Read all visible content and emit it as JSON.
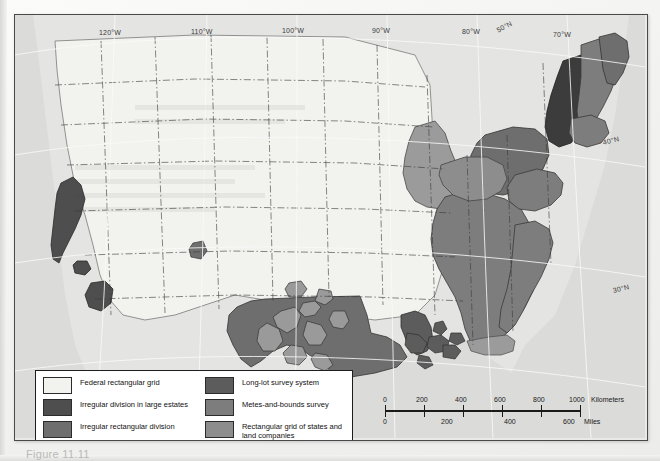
{
  "document": {
    "type": "map-figure",
    "caption": "Figure 11.11"
  },
  "map": {
    "title": "Land survey systems of the United States",
    "background_color": "#e9e9e7",
    "ocean_color": "#dededc",
    "frame_color": "#4a4a4a",
    "graticule": {
      "longitude_labels": [
        "120°W",
        "110°W",
        "100°W",
        "90°W",
        "80°W",
        "70°W"
      ],
      "latitude_labels": [
        "50°N",
        "40°N",
        "30°N"
      ]
    }
  },
  "legend": {
    "left_column": [
      {
        "label": "Federal rectangular grid",
        "color": "#f2f2ef"
      },
      {
        "label": "Irregular division in large estates",
        "color": "#4e4e4e"
      },
      {
        "label": "Irregular rectangular division",
        "color": "#6e6e6e"
      },
      {
        "label": "Land settled and subdivided by townships",
        "color": "#9b9b9b"
      }
    ],
    "right_column": [
      {
        "label": "Long-lot survey system",
        "color": "#5c5c5c"
      },
      {
        "label": "Metes-and-bounds survey",
        "color": "#7d7d7d"
      },
      {
        "label": "Rectangular grid of states and land companies",
        "color": "#8d8d8d"
      }
    ]
  },
  "scale_bar": {
    "kilometers": {
      "ticks": [
        "0",
        "200",
        "400",
        "600",
        "800",
        "1000"
      ],
      "unit": "Kilometers"
    },
    "miles": {
      "ticks": [
        "0",
        "200",
        "400",
        "600"
      ],
      "unit": "Miles"
    }
  }
}
